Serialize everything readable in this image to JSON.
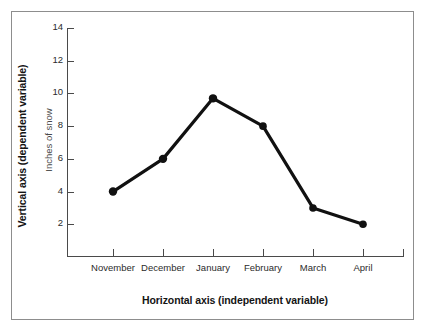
{
  "chart_data": {
    "type": "line",
    "title": "",
    "xlabel": "Horizontal axis (independent variable)",
    "ylabel": "Vertical axis (dependent variable)",
    "y_unit_label": "Inches of snow",
    "categories": [
      "November",
      "December",
      "January",
      "February",
      "March",
      "April"
    ],
    "values": [
      4,
      6,
      9.7,
      8,
      3,
      2
    ],
    "series": [
      {
        "name": "Inches of snow",
        "values": [
          4,
          6,
          9.7,
          8,
          3,
          2
        ]
      }
    ],
    "y_ticks": [
      2,
      4,
      6,
      8,
      10,
      12,
      14
    ],
    "ylim": [
      0,
      14
    ],
    "grid": false,
    "legend": false,
    "legend_position": "none",
    "line_color": "#111111",
    "marker": "circle",
    "marker_color": "#111111",
    "axis_color": "#4a4a4a",
    "frame_color": "#8d8d8d",
    "background": "#ffffff"
  }
}
